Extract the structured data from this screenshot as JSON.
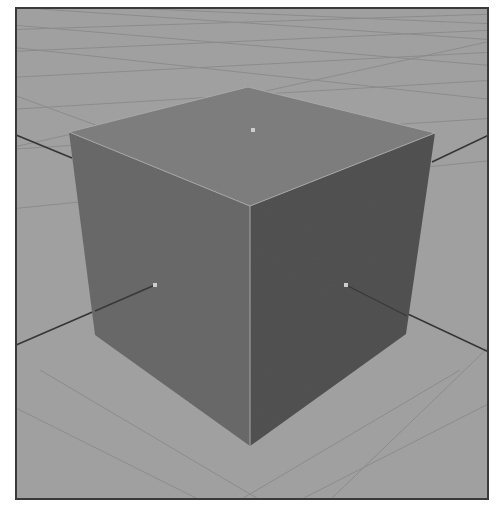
{
  "scene": {
    "object": "cube",
    "view": "perspective",
    "colors": {
      "ground": "#aaaaaa",
      "grid_line": "#8e8e8e",
      "top_face": "#7a7a7a",
      "left_face": "#5f5f5f",
      "right_face": "#3e3e3e",
      "edge_highlight": "#b8b8b8",
      "axis_line": "#1a1a1a",
      "pivot": "#e6e6e6",
      "frame": "#3a3a3a"
    },
    "vertices": {
      "top_back": [
        248,
        87
      ],
      "top_left": [
        69,
        132
      ],
      "top_right": [
        435,
        133
      ],
      "top_front": [
        250,
        206
      ],
      "bottom_left": [
        95,
        335
      ],
      "bottom_right": [
        406,
        334
      ],
      "bottom_front": [
        250,
        446
      ]
    },
    "pivots": [
      {
        "name": "top",
        "pos": [
          253,
          130
        ]
      },
      {
        "name": "left",
        "pos": [
          155,
          285
        ]
      },
      {
        "name": "right",
        "pos": [
          346,
          285
        ]
      }
    ]
  }
}
